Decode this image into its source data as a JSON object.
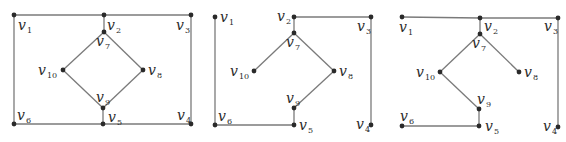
{
  "figure": {
    "colors": {
      "edge": "#7a7a7a",
      "node": "#2a2a2a",
      "label": "#2a2a2a",
      "background": "#ffffff"
    },
    "graphs": [
      {
        "id": "graph-original",
        "nodes": [
          {
            "id": "v1",
            "base": "v",
            "sub": "1",
            "x": 14,
            "y": 15,
            "lx": 18,
            "ly": 30,
            "sx": 27,
            "sy": 33
          },
          {
            "id": "v2",
            "base": "v",
            "sub": "2",
            "x": 104,
            "y": 15,
            "lx": 107,
            "ly": 30,
            "sx": 116,
            "sy": 33
          },
          {
            "id": "v3",
            "base": "v",
            "sub": "3",
            "x": 191,
            "y": 15,
            "lx": 176,
            "ly": 30,
            "sx": 185,
            "sy": 33
          },
          {
            "id": "v4",
            "base": "v",
            "sub": "4",
            "x": 191,
            "y": 124,
            "lx": 177,
            "ly": 120,
            "sx": 186,
            "sy": 123
          },
          {
            "id": "v5",
            "base": "v",
            "sub": "5",
            "x": 103,
            "y": 124,
            "lx": 108,
            "ly": 122,
            "sx": 117,
            "sy": 125
          },
          {
            "id": "v6",
            "base": "v",
            "sub": "6",
            "x": 14,
            "y": 124,
            "lx": 17,
            "ly": 120,
            "sx": 26,
            "sy": 123
          },
          {
            "id": "v7",
            "base": "v",
            "sub": "7",
            "x": 104,
            "y": 32,
            "lx": 96,
            "ly": 46,
            "sx": 105,
            "sy": 49
          },
          {
            "id": "v8",
            "base": "v",
            "sub": "8",
            "x": 143,
            "y": 70,
            "lx": 148,
            "ly": 75,
            "sx": 157,
            "sy": 78
          },
          {
            "id": "v9",
            "base": "v",
            "sub": "9",
            "x": 103,
            "y": 108,
            "lx": 96,
            "ly": 102,
            "sx": 105,
            "sy": 105
          },
          {
            "id": "v10",
            "base": "v",
            "sub": "10",
            "x": 63,
            "y": 70,
            "lx": 38,
            "ly": 75,
            "sx": 47,
            "sy": 78
          }
        ],
        "edges": [
          [
            "v1",
            "v2"
          ],
          [
            "v2",
            "v3"
          ],
          [
            "v3",
            "v4"
          ],
          [
            "v4",
            "v5"
          ],
          [
            "v5",
            "v6"
          ],
          [
            "v6",
            "v1"
          ],
          [
            "v2",
            "v7"
          ],
          [
            "v7",
            "v8"
          ],
          [
            "v8",
            "v9"
          ],
          [
            "v9",
            "v10"
          ],
          [
            "v10",
            "v7"
          ],
          [
            "v9",
            "v5"
          ]
        ]
      },
      {
        "id": "spanning-tree-1",
        "nodes": [
          {
            "id": "v1",
            "base": "v",
            "sub": "1",
            "x": 215,
            "y": 17,
            "lx": 220,
            "ly": 22,
            "sx": 229,
            "sy": 25
          },
          {
            "id": "v2",
            "base": "v",
            "sub": "2",
            "x": 294,
            "y": 17,
            "lx": 277,
            "ly": 21,
            "sx": 286,
            "sy": 24
          },
          {
            "id": "v3",
            "base": "v",
            "sub": "3",
            "x": 371,
            "y": 17,
            "lx": 357,
            "ly": 31,
            "sx": 366,
            "sy": 34
          },
          {
            "id": "v4",
            "base": "v",
            "sub": "4",
            "x": 371,
            "y": 125,
            "lx": 356,
            "ly": 129,
            "sx": 365,
            "sy": 132
          },
          {
            "id": "v5",
            "base": "v",
            "sub": "5",
            "x": 294,
            "y": 125,
            "lx": 299,
            "ly": 130,
            "sx": 308,
            "sy": 133
          },
          {
            "id": "v6",
            "base": "v",
            "sub": "6",
            "x": 215,
            "y": 125,
            "lx": 218,
            "ly": 121,
            "sx": 227,
            "sy": 124
          },
          {
            "id": "v7",
            "base": "v",
            "sub": "7",
            "x": 294,
            "y": 33,
            "lx": 286,
            "ly": 47,
            "sx": 295,
            "sy": 50
          },
          {
            "id": "v8",
            "base": "v",
            "sub": "8",
            "x": 334,
            "y": 71,
            "lx": 339,
            "ly": 76,
            "sx": 348,
            "sy": 79
          },
          {
            "id": "v9",
            "base": "v",
            "sub": "9",
            "x": 294,
            "y": 108,
            "lx": 286,
            "ly": 103,
            "sx": 295,
            "sy": 106
          },
          {
            "id": "v10",
            "base": "v",
            "sub": "10",
            "x": 254,
            "y": 71,
            "lx": 230,
            "ly": 76,
            "sx": 239,
            "sy": 79
          }
        ],
        "edges": [
          [
            "v1",
            "v6"
          ],
          [
            "v6",
            "v5"
          ],
          [
            "v5",
            "v9"
          ],
          [
            "v9",
            "v8"
          ],
          [
            "v8",
            "v7"
          ],
          [
            "v7",
            "v10"
          ],
          [
            "v7",
            "v2"
          ],
          [
            "v2",
            "v3"
          ],
          [
            "v3",
            "v4"
          ]
        ]
      },
      {
        "id": "spanning-tree-2",
        "nodes": [
          {
            "id": "v1",
            "base": "v",
            "sub": "1",
            "x": 402,
            "y": 17,
            "lx": 399,
            "ly": 32,
            "sx": 408,
            "sy": 35
          },
          {
            "id": "v2",
            "base": "v",
            "sub": "2",
            "x": 480,
            "y": 18,
            "lx": 484,
            "ly": 31,
            "sx": 493,
            "sy": 34
          },
          {
            "id": "v3",
            "base": "v",
            "sub": "3",
            "x": 558,
            "y": 18,
            "lx": 544,
            "ly": 31,
            "sx": 553,
            "sy": 34
          },
          {
            "id": "v4",
            "base": "v",
            "sub": "4",
            "x": 558,
            "y": 127,
            "lx": 543,
            "ly": 131,
            "sx": 552,
            "sy": 134
          },
          {
            "id": "v5",
            "base": "v",
            "sub": "5",
            "x": 479,
            "y": 126,
            "lx": 485,
            "ly": 131,
            "sx": 494,
            "sy": 134
          },
          {
            "id": "v6",
            "base": "v",
            "sub": "6",
            "x": 402,
            "y": 126,
            "lx": 400,
            "ly": 121,
            "sx": 409,
            "sy": 124
          },
          {
            "id": "v7",
            "base": "v",
            "sub": "7",
            "x": 480,
            "y": 34,
            "lx": 472,
            "ly": 48,
            "sx": 481,
            "sy": 51
          },
          {
            "id": "v8",
            "base": "v",
            "sub": "8",
            "x": 519,
            "y": 72,
            "lx": 524,
            "ly": 77,
            "sx": 533,
            "sy": 80
          },
          {
            "id": "v9",
            "base": "v",
            "sub": "9",
            "x": 479,
            "y": 109,
            "lx": 477,
            "ly": 104,
            "sx": 486,
            "sy": 107
          },
          {
            "id": "v10",
            "base": "v",
            "sub": "10",
            "x": 440,
            "y": 72,
            "lx": 416,
            "ly": 77,
            "sx": 425,
            "sy": 80
          }
        ],
        "edges": [
          [
            "v1",
            "v2"
          ],
          [
            "v2",
            "v3"
          ],
          [
            "v3",
            "v4"
          ],
          [
            "v2",
            "v7"
          ],
          [
            "v7",
            "v10"
          ],
          [
            "v7",
            "v8"
          ],
          [
            "v10",
            "v9"
          ],
          [
            "v9",
            "v5"
          ],
          [
            "v5",
            "v6"
          ]
        ]
      }
    ]
  }
}
